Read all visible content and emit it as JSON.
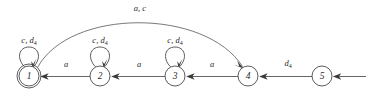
{
  "figure": {
    "kind": "finite-state-automaton-diagram",
    "background_color": "#ffffff",
    "stroke_color": "#4a4a4a",
    "text_color": "#2a2a2a"
  },
  "states": [
    {
      "id": "1",
      "label": "1",
      "cx": 29,
      "cy": 76,
      "r": 10,
      "accepting": true,
      "initial": false
    },
    {
      "id": "2",
      "label": "2",
      "cx": 100,
      "cy": 76,
      "r": 10,
      "accepting": false,
      "initial": false
    },
    {
      "id": "3",
      "label": "3",
      "cx": 175,
      "cy": 76,
      "r": 10,
      "accepting": false,
      "initial": false
    },
    {
      "id": "4",
      "label": "4",
      "cx": 248,
      "cy": 76,
      "r": 10,
      "accepting": false,
      "initial": false
    },
    {
      "id": "5",
      "label": "5",
      "cx": 322,
      "cy": 76,
      "r": 10,
      "accepting": false,
      "initial": true
    }
  ],
  "self_loops": [
    {
      "state": "1",
      "label_main": "c, d",
      "label_sub": "4",
      "label_x": 29,
      "label_y": 43
    },
    {
      "state": "2",
      "label_main": "c, d",
      "label_sub": "4",
      "label_x": 100,
      "label_y": 43
    },
    {
      "state": "3",
      "label_main": "c, d",
      "label_sub": "4",
      "label_x": 175,
      "label_y": 43
    }
  ],
  "transitions": [
    {
      "from": "2",
      "to": "1",
      "label_main": "a",
      "label_sub": "",
      "label_x": 66,
      "label_y": 67
    },
    {
      "from": "3",
      "to": "2",
      "label_main": "a",
      "label_sub": "",
      "label_x": 139,
      "label_y": 67
    },
    {
      "from": "4",
      "to": "3",
      "label_main": "a",
      "label_sub": "",
      "label_x": 212,
      "label_y": 67
    },
    {
      "from": "5",
      "to": "4",
      "label_main": "d",
      "label_sub": "4",
      "label_x": 288,
      "label_y": 66
    }
  ],
  "arc_transition": {
    "from": "1",
    "to": "4",
    "label_main": "a, c",
    "label_sub": "",
    "label_x": 140,
    "label_y": 11
  },
  "start_arrow": {
    "into_state": "5",
    "direction": "left"
  }
}
